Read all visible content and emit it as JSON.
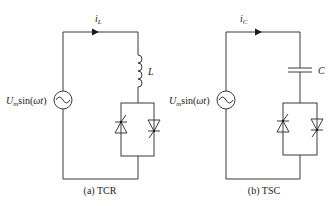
{
  "figure": {
    "panels": [
      {
        "id": "a",
        "caption": "(a)  TCR",
        "current_label": "i",
        "current_sub": "L",
        "source_label_main": "U",
        "source_label_sub": "m",
        "source_label_func": "sin(",
        "source_label_arg": "ωt",
        "source_label_close": ")",
        "component_label": "L",
        "component_type": "inductor",
        "switch_type": "anti-parallel thyristors"
      },
      {
        "id": "b",
        "caption": "(b)  TSC",
        "current_label": "i",
        "current_sub": "C",
        "source_label_main": "U",
        "source_label_sub": "m",
        "source_label_func": "sin(",
        "source_label_arg": "ωt",
        "source_label_close": ")",
        "component_label": "C",
        "component_type": "capacitor",
        "switch_type": "anti-parallel thyristors"
      }
    ],
    "colors": {
      "wire": "#3a3a3a",
      "text": "#1a1a1a"
    }
  }
}
